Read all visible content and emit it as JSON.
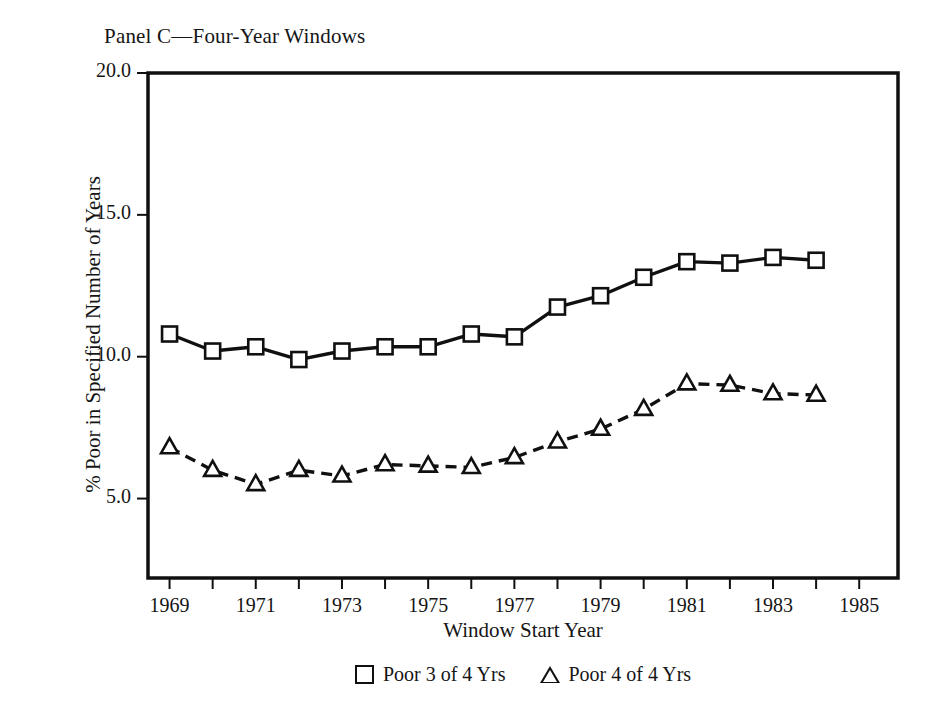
{
  "chart_data": {
    "type": "line",
    "title": "Panel C—Four-Year Windows",
    "xlabel": "Window Start Year",
    "ylabel": "% Poor in Specified Number of Years",
    "x": [
      1969,
      1970,
      1971,
      1972,
      1973,
      1974,
      1975,
      1976,
      1977,
      1978,
      1979,
      1980,
      1981,
      1982,
      1983,
      1984
    ],
    "xlim": [
      1968.5,
      1985.9
    ],
    "ylim": [
      2.2,
      20.0
    ],
    "xticks": [
      1969,
      1970,
      1971,
      1972,
      1973,
      1974,
      1975,
      1976,
      1977,
      1978,
      1979,
      1980,
      1981,
      1982,
      1983,
      1984,
      1985
    ],
    "xtick_labels": [
      "1969",
      "",
      "1971",
      "",
      "1973",
      "",
      "1975",
      "",
      "1977",
      "",
      "1979",
      "",
      "1981",
      "",
      "1983",
      "",
      "1985"
    ],
    "yticks": [
      5.0,
      10.0,
      15.0,
      20.0
    ],
    "ytick_labels": [
      "5.0",
      "10.0",
      "15.0",
      "20.0"
    ],
    "grid": false,
    "legend_position": "below",
    "series": [
      {
        "name": "Poor 3 of 4 Yrs",
        "marker": "square",
        "line_style": "solid",
        "color": "#101010",
        "values": [
          10.8,
          10.2,
          10.35,
          9.9,
          10.2,
          10.35,
          10.35,
          10.8,
          10.7,
          11.75,
          12.15,
          12.8,
          13.35,
          13.3,
          13.5,
          13.4
        ]
      },
      {
        "name": "Poor 4 of 4 Yrs",
        "marker": "triangle",
        "line_style": "dashed",
        "color": "#101010",
        "values": [
          6.8,
          6.0,
          5.5,
          6.0,
          5.8,
          6.2,
          6.15,
          6.1,
          6.45,
          7.0,
          7.45,
          8.15,
          9.05,
          9.0,
          8.7,
          8.65
        ]
      }
    ]
  },
  "legend": {
    "entries": [
      {
        "label": "Poor 3 of 4 Yrs",
        "glyph": "square-outline-icon"
      },
      {
        "label": "Poor 4 of 4 Yrs",
        "glyph": "triangle-outline-icon"
      }
    ]
  }
}
